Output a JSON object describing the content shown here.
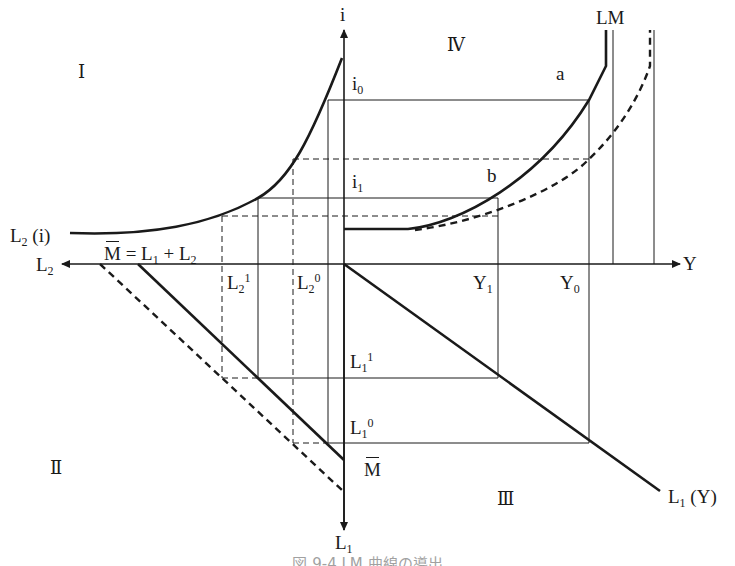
{
  "diagram": {
    "type": "four-quadrant LM curve derivation",
    "axes": {
      "up": "i",
      "right": "Y",
      "left": "L",
      "left_sub": "2",
      "down": "L",
      "down_sub": "1"
    },
    "quadrants": {
      "q1": "Ⅰ",
      "q2": "Ⅱ",
      "q3": "Ⅲ",
      "q4": "Ⅳ"
    },
    "labels": {
      "i0_main": "i",
      "i0_sub": "0",
      "i1_main": "i",
      "i1_sub": "1",
      "point_a": "a",
      "point_b": "b",
      "lm": "LM",
      "y1_main": "Y",
      "y1_sub": "1",
      "y0_main": "Y",
      "y0_sub": "0",
      "l2_1_main": "L",
      "l2_1_sub": "2",
      "l2_1_sup": "1",
      "l2_0_main": "L",
      "l2_0_sub": "2",
      "l2_0_sup": "0",
      "l1_1_main": "L",
      "l1_1_sub": "1",
      "l1_1_sup": "1",
      "l1_0_main": "L",
      "l1_0_sub": "1",
      "l1_0_sup": "0",
      "mbar": "M",
      "l2i_main": "L",
      "l2i_sub": "2",
      "l2i_arg": " (i)",
      "l1y_main": "L",
      "l1y_sub": "1",
      "l1y_arg": " (Y)",
      "money_eq_m": "M",
      "money_eq_rest": " = L",
      "money_eq_sub1": "1",
      "money_eq_plus": " + L",
      "money_eq_sub2": "2"
    },
    "curves": [
      {
        "name": "L2(i) speculative demand",
        "quadrant": "I",
        "style": "solid"
      },
      {
        "name": "M̄ = L1 + L2 money supply constraint",
        "quadrant": "II",
        "style": "solid"
      },
      {
        "name": "shifted money supply",
        "quadrant": "II",
        "style": "dashed"
      },
      {
        "name": "L1(Y) transactions demand",
        "quadrant": "III",
        "style": "solid"
      },
      {
        "name": "LM",
        "quadrant": "IV",
        "style": "solid"
      },
      {
        "name": "shifted LM",
        "quadrant": "IV",
        "style": "dashed"
      }
    ]
  },
  "caption": "図 9-4  LM 曲線の導出"
}
